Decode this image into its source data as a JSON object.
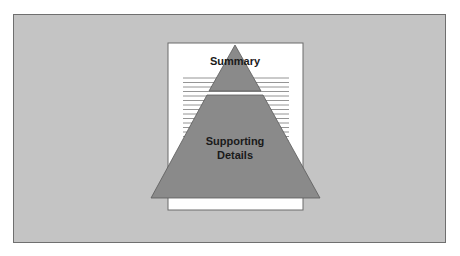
{
  "diagram": {
    "type": "inverted-pyramid-on-document",
    "labels": {
      "top": "Summary",
      "bottom_line1": "Supporting",
      "bottom_line2": "Details"
    },
    "colors": {
      "background": "#c4c4c4",
      "paper": "#ffffff",
      "pyramid": "#8a8a8a",
      "text_lines": "#7a7a7a"
    }
  }
}
